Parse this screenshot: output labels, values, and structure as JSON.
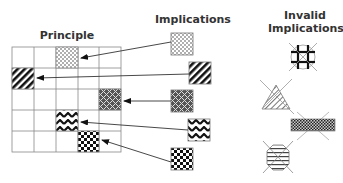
{
  "titles": {
    "principle": "Principle",
    "implications": "Implications",
    "invalid_line1": "Invalid",
    "invalid_line2": "Implications"
  },
  "principle_grid": {
    "rows": 5,
    "cols": 5,
    "filled_cells": [
      {
        "row": 0,
        "col": 2,
        "pattern": "dots"
      },
      {
        "row": 1,
        "col": 0,
        "pattern": "diagonal-stripes"
      },
      {
        "row": 2,
        "col": 4,
        "pattern": "weave"
      },
      {
        "row": 3,
        "col": 2,
        "pattern": "zigzag"
      },
      {
        "row": 4,
        "col": 3,
        "pattern": "checkerboard"
      }
    ]
  },
  "implications": [
    {
      "pattern": "dots",
      "points_to": "row 0, col 2"
    },
    {
      "pattern": "diagonal-stripes",
      "points_to": "row 1, col 0"
    },
    {
      "pattern": "weave",
      "points_to": "row 2, col 4"
    },
    {
      "pattern": "zigzag",
      "points_to": "row 3, col 2"
    },
    {
      "pattern": "checkerboard",
      "points_to": "row 4, col 3"
    }
  ],
  "invalid_implications": [
    {
      "shape": "circle",
      "pattern": "thick-grid",
      "crossed_out": true
    },
    {
      "shape": "triangle",
      "pattern": "diagonal-hatch",
      "crossed_out": true
    },
    {
      "shape": "rectangle",
      "pattern": "fine-checkerboard",
      "crossed_out": true
    },
    {
      "shape": "octagon",
      "pattern": "horizontal-stripes",
      "crossed_out": true
    }
  ]
}
